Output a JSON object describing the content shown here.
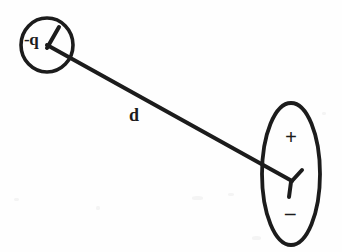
{
  "figure": {
    "background_color": "#fefefe",
    "stroke_color": "#1c1c1c",
    "labels": {
      "negative_charge": "-q",
      "distance": "d",
      "dipole_positive": "+",
      "dipole_negative": "–"
    },
    "shapes": {
      "point_charge_circle": {
        "name": "circle",
        "center_x": 47,
        "center_y": 45,
        "radius_x": 26,
        "radius_y": 27
      },
      "dipole_ellipse": {
        "name": "ellipse",
        "center_x": 291,
        "center_y": 174,
        "radius_x": 29,
        "radius_y": 71
      },
      "separation_line": {
        "name": "line",
        "x1": 47,
        "y1": 45,
        "x2": 292,
        "y2": 181
      }
    }
  }
}
